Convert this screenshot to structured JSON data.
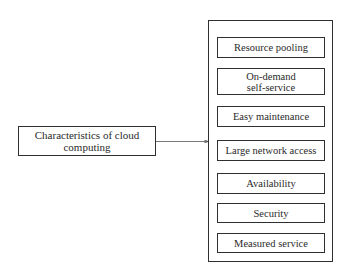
{
  "diagram": {
    "source": {
      "label": "Characteristics of cloud computing"
    },
    "connector": {
      "type": "arrow",
      "from": "source",
      "to": "characteristics-group"
    },
    "characteristics": [
      {
        "label": "Resource pooling"
      },
      {
        "label": "On-demand self-service"
      },
      {
        "label": "Easy maintenance"
      },
      {
        "label": "Large network access"
      },
      {
        "label": "Availability"
      },
      {
        "label": "Security"
      },
      {
        "label": "Measured service"
      }
    ]
  }
}
